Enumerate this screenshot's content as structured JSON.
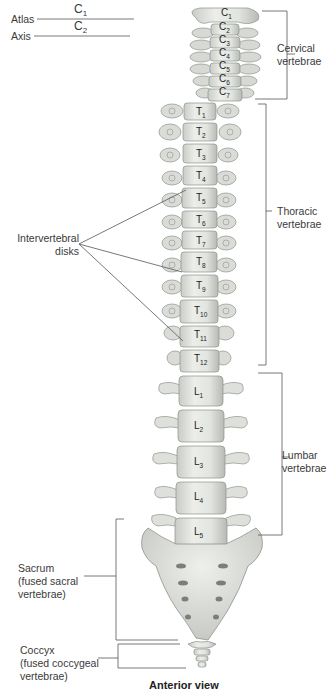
{
  "figure": {
    "title": "Anterior view",
    "left_labels": {
      "atlas": {
        "name": "Atlas",
        "vertebra": "C",
        "sub": "1"
      },
      "axis": {
        "name": "Axis",
        "vertebra": "C",
        "sub": "2"
      },
      "intervertebral": [
        "Intervertebral",
        "disks"
      ],
      "sacrum": [
        "Sacrum",
        "(fused sacral",
        "vertebrae)"
      ],
      "coccyx": [
        "Coccyx",
        "(fused coccygeal",
        "vertebrae)"
      ]
    },
    "right_labels": {
      "cervical": [
        "Cervical",
        "vertebrae"
      ],
      "thoracic": [
        "Thoracic",
        "vertebrae"
      ],
      "lumbar": [
        "Lumbar",
        "vertebrae"
      ]
    },
    "vertebrae": {
      "cervical": [
        {
          "l": "C",
          "s": "1"
        },
        {
          "l": "C",
          "s": "2"
        },
        {
          "l": "C",
          "s": "3"
        },
        {
          "l": "C",
          "s": "4"
        },
        {
          "l": "C",
          "s": "5"
        },
        {
          "l": "C",
          "s": "6"
        },
        {
          "l": "C",
          "s": "7"
        }
      ],
      "thoracic": [
        {
          "l": "T",
          "s": "1"
        },
        {
          "l": "T",
          "s": "2"
        },
        {
          "l": "T",
          "s": "3"
        },
        {
          "l": "T",
          "s": "4"
        },
        {
          "l": "T",
          "s": "5"
        },
        {
          "l": "T",
          "s": "6"
        },
        {
          "l": "T",
          "s": "7"
        },
        {
          "l": "T",
          "s": "8"
        },
        {
          "l": "T",
          "s": "9"
        },
        {
          "l": "T",
          "s": "10"
        },
        {
          "l": "T",
          "s": "11"
        },
        {
          "l": "T",
          "s": "12"
        }
      ],
      "lumbar": [
        {
          "l": "L",
          "s": "1"
        },
        {
          "l": "L",
          "s": "2"
        },
        {
          "l": "L",
          "s": "3"
        },
        {
          "l": "L",
          "s": "4"
        },
        {
          "l": "L",
          "s": "5"
        }
      ]
    },
    "colors": {
      "bone": "#e4e6e2",
      "bone_shadow": "#b9bdb8",
      "bone_outline": "#8e928d",
      "leader_line": "#555555"
    }
  }
}
